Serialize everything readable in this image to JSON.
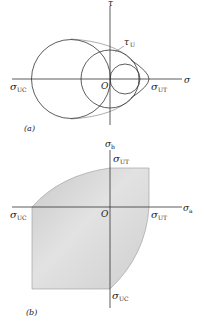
{
  "figure_a": {
    "caption": "(a)",
    "axis_x_label": "σ",
    "axis_y_label": "τ",
    "origin_label": "O",
    "tau_u_label": "τ",
    "tau_u_sub": "U",
    "sigma_uc_label": "σ",
    "sigma_uc_sub": "UC",
    "sigma_ut_label": "σ",
    "sigma_ut_sub": "UT"
  },
  "figure_b": {
    "caption": "(b)",
    "axis_x_label": "σ",
    "axis_x_sub": "a",
    "axis_y_label": "σ",
    "axis_y_sub": "b",
    "origin_label": "O",
    "top_label": "σ",
    "top_sub": "UT",
    "right_label": "σ",
    "right_sub": "UT",
    "left_label": "σ",
    "left_sub": "UC",
    "bottom_label": "σ",
    "bottom_sub": "UC",
    "fill_color": "#d4d4d4"
  }
}
